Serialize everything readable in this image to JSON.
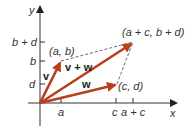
{
  "diagram": {
    "colors": {
      "axis": "#333333",
      "vector": "#b8401e",
      "dashed": "#444444",
      "text": "#333333"
    },
    "axes": {
      "x_label": "x",
      "y_label": "y"
    },
    "x_ticks": [
      {
        "label": "a"
      },
      {
        "label": "c"
      },
      {
        "label": "a + c"
      }
    ],
    "y_ticks": [
      {
        "label": "b + d"
      },
      {
        "label": "b"
      },
      {
        "label": "d"
      }
    ],
    "points": {
      "ab": "(a, b)",
      "cd": "(c, d)",
      "sum": "(a + c, b + d)"
    },
    "vectors": {
      "v": "v",
      "w": "w",
      "sum": "v + w"
    }
  }
}
